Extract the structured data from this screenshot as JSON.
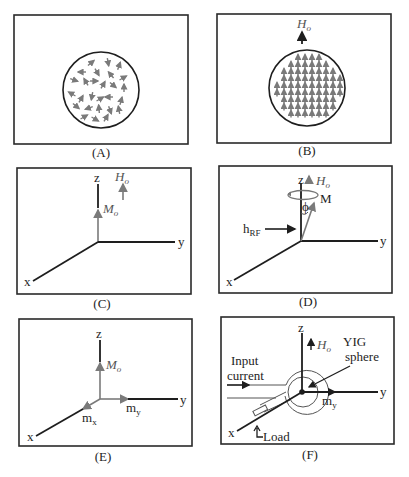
{
  "figure": {
    "panels": [
      {
        "id": "A",
        "caption": "(A)",
        "description": "Randomly oriented magnetic dipoles in a sphere"
      },
      {
        "id": "B",
        "caption": "(B)",
        "description": "Dipoles aligned with applied field",
        "field_label": "H",
        "field_sub": "o"
      },
      {
        "id": "C",
        "caption": "(C)",
        "axes": {
          "x": "x",
          "y": "y",
          "z": "z"
        },
        "field_label": "H",
        "field_sub": "o",
        "moment_label": "M",
        "moment_sub": "o"
      },
      {
        "id": "D",
        "caption": "(D)",
        "axes": {
          "x": "x",
          "y": "y",
          "z": "z"
        },
        "field_label": "H",
        "field_sub": "o",
        "moment_label": "M",
        "angle_label": "ϕ",
        "rf_label": "h",
        "rf_sub": "RF"
      },
      {
        "id": "E",
        "caption": "(E)",
        "axes": {
          "x": "x",
          "y": "y",
          "z": "z"
        },
        "moment_label": "M",
        "moment_sub": "o",
        "mx_label": "m",
        "mx_sub": "x",
        "my_label": "m",
        "my_sub": "y"
      },
      {
        "id": "F",
        "caption": "(F)",
        "axes": {
          "x": "x",
          "y": "y",
          "z": "z"
        },
        "field_label": "H",
        "field_sub": "o",
        "input_line1": "Input",
        "input_line2": "current",
        "yig_line1": "YIG",
        "yig_line2": "sphere",
        "my_label": "m",
        "my_sub": "y",
        "load_label": "Load"
      }
    ]
  },
  "colors": {
    "line": "#1e1e1e",
    "vector": "#7a7a7a",
    "background": "#ffffff"
  }
}
